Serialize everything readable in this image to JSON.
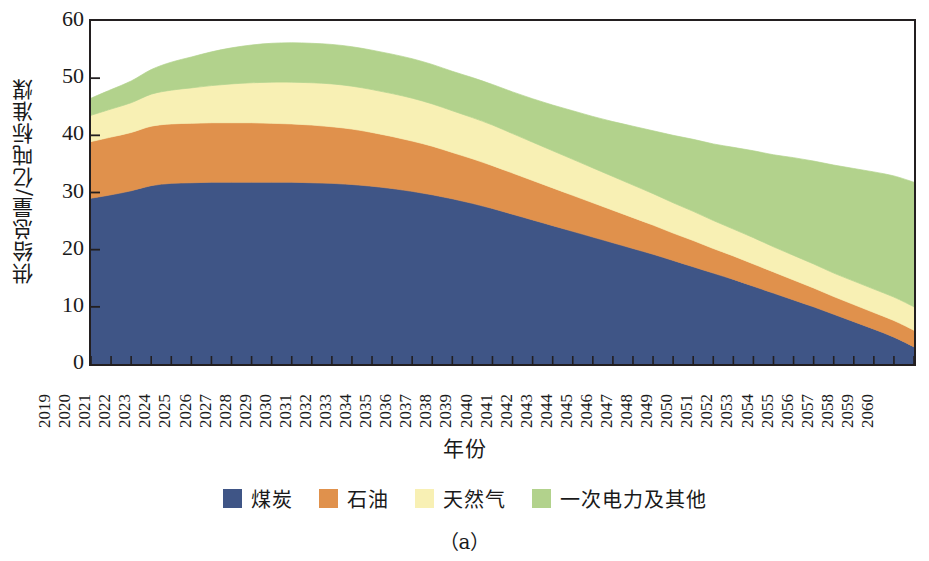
{
  "figure": {
    "caption": "（a）"
  },
  "axes": {
    "ylabel": "供给总量/亿吨标准煤",
    "xlabel": "年份",
    "yticks": [
      0,
      10,
      20,
      30,
      40,
      50,
      60
    ],
    "ylim": [
      0,
      60
    ],
    "xticks": [
      "2019",
      "2020",
      "2021",
      "2022",
      "2023",
      "2024",
      "2025",
      "2026",
      "2027",
      "2028",
      "2029",
      "2030",
      "2031",
      "2032",
      "2033",
      "2034",
      "2035",
      "2036",
      "2037",
      "2038",
      "2039",
      "2040",
      "2041",
      "2042",
      "2043",
      "2044",
      "2045",
      "2046",
      "2047",
      "2048",
      "2049",
      "2050",
      "2051",
      "2052",
      "2053",
      "2054",
      "2055",
      "2056",
      "2057",
      "2058",
      "2059",
      "2060"
    ]
  },
  "legend": {
    "position": "bottom-center",
    "items": [
      {
        "label": "煤炭",
        "color": "#3f5586"
      },
      {
        "label": "石油",
        "color": "#e0914c"
      },
      {
        "label": "天然气",
        "color": "#f8f0b4"
      },
      {
        "label": "一次电力及其他",
        "color": "#b2d28c"
      }
    ]
  },
  "colors": {
    "coal": "#3f5586",
    "oil": "#e0914c",
    "gas": "#f8f0b4",
    "primary_power": "#b2d28c",
    "axis": "#231f20",
    "background": "#ffffff"
  },
  "chart_data": {
    "type": "area",
    "title": "",
    "subtitle": "",
    "xlabel": "年份",
    "ylabel": "供给总量/亿吨标准煤",
    "ylim": [
      0,
      60
    ],
    "grid": false,
    "stacked": true,
    "legend_position": "bottom-center",
    "x": [
      2019,
      2020,
      2021,
      2022,
      2023,
      2024,
      2025,
      2026,
      2027,
      2028,
      2029,
      2030,
      2031,
      2032,
      2033,
      2034,
      2035,
      2036,
      2037,
      2038,
      2039,
      2040,
      2041,
      2042,
      2043,
      2044,
      2045,
      2046,
      2047,
      2048,
      2049,
      2050,
      2051,
      2052,
      2053,
      2054,
      2055,
      2056,
      2057,
      2058,
      2059,
      2060
    ],
    "categories": [
      "2019",
      "2020",
      "2021",
      "2022",
      "2023",
      "2024",
      "2025",
      "2026",
      "2027",
      "2028",
      "2029",
      "2030",
      "2031",
      "2032",
      "2033",
      "2034",
      "2035",
      "2036",
      "2037",
      "2038",
      "2039",
      "2040",
      "2041",
      "2042",
      "2043",
      "2044",
      "2045",
      "2046",
      "2047",
      "2048",
      "2049",
      "2050",
      "2051",
      "2052",
      "2053",
      "2054",
      "2055",
      "2056",
      "2057",
      "2058",
      "2059",
      "2060"
    ],
    "series": [
      {
        "name": "煤炭",
        "color": "#3f5586",
        "values": [
          29.0,
          29.6,
          30.3,
          31.2,
          31.6,
          31.7,
          31.8,
          31.8,
          31.8,
          31.8,
          31.8,
          31.7,
          31.6,
          31.4,
          31.1,
          30.7,
          30.2,
          29.6,
          28.9,
          28.1,
          27.2,
          26.2,
          25.2,
          24.2,
          23.2,
          22.2,
          21.2,
          20.2,
          19.2,
          18.1,
          17.0,
          15.9,
          14.8,
          13.6,
          12.4,
          11.2,
          10.0,
          8.7,
          7.4,
          6.1,
          4.7,
          3.0
        ]
      },
      {
        "name": "石油",
        "color": "#e0914c",
        "values": [
          9.9,
          10.1,
          10.2,
          10.4,
          10.4,
          10.4,
          10.4,
          10.4,
          10.4,
          10.3,
          10.2,
          10.1,
          9.9,
          9.7,
          9.4,
          9.1,
          8.8,
          8.5,
          8.1,
          7.8,
          7.5,
          7.2,
          6.9,
          6.6,
          6.3,
          6.0,
          5.7,
          5.4,
          5.1,
          4.8,
          4.6,
          4.3,
          4.1,
          3.9,
          3.7,
          3.5,
          3.3,
          3.1,
          3.0,
          2.9,
          2.9,
          2.9
        ]
      },
      {
        "name": "天然气",
        "color": "#f8f0b4",
        "values": [
          4.6,
          4.9,
          5.2,
          5.6,
          5.9,
          6.2,
          6.5,
          6.8,
          7.0,
          7.2,
          7.3,
          7.4,
          7.5,
          7.5,
          7.5,
          7.5,
          7.5,
          7.4,
          7.3,
          7.2,
          7.1,
          6.9,
          6.7,
          6.5,
          6.3,
          6.1,
          5.9,
          5.7,
          5.5,
          5.3,
          5.1,
          4.9,
          4.7,
          4.6,
          4.4,
          4.3,
          4.2,
          4.1,
          4.1,
          4.1,
          4.1,
          4.1
        ]
      },
      {
        "name": "一次电力及其他",
        "color": "#b2d28c",
        "values": [
          3.0,
          3.4,
          3.8,
          4.3,
          4.9,
          5.4,
          5.9,
          6.3,
          6.6,
          6.8,
          6.9,
          6.9,
          6.9,
          6.9,
          6.9,
          6.9,
          6.9,
          6.9,
          6.9,
          7.0,
          7.1,
          7.3,
          7.6,
          8.0,
          8.5,
          9.0,
          9.6,
          10.3,
          11.0,
          11.8,
          12.6,
          13.4,
          14.3,
          15.2,
          16.1,
          17.1,
          18.0,
          18.9,
          19.7,
          20.5,
          21.2,
          21.8
        ]
      }
    ],
    "totals": [
      46.5,
      48.0,
      49.5,
      51.5,
      52.8,
      53.7,
      54.6,
      55.3,
      55.8,
      56.1,
      56.2,
      56.1,
      55.9,
      55.5,
      54.9,
      54.2,
      53.4,
      52.4,
      51.2,
      50.1,
      48.9,
      47.6,
      46.4,
      45.3,
      44.3,
      43.3,
      42.4,
      41.6,
      40.8,
      40.0,
      39.3,
      38.5,
      37.9,
      37.3,
      36.6,
      36.1,
      35.5,
      34.8,
      34.2,
      33.6,
      32.9,
      31.8
    ]
  }
}
